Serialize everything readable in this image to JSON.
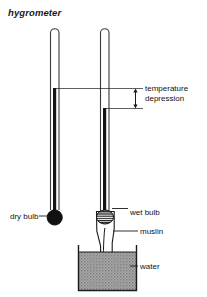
{
  "figure": {
    "title": "hygrometer",
    "type": "labelled-science-diagram",
    "canvas": {
      "width": 207,
      "height": 297
    },
    "colors": {
      "ink": "#1a1a1a",
      "tube_outline": "#3a3a3a",
      "mercury": "#141414",
      "bulb_fill": "#111111",
      "water_fill": "#9e9e9e",
      "background": "#ffffff"
    }
  },
  "labels": {
    "dry_bulb": "dry bulb",
    "wet_bulb": "wet bulb",
    "muslin": "muslin",
    "water": "water",
    "temperature_depression_line1": "temperature",
    "temperature_depression_line2": "depression"
  },
  "parts": [
    {
      "name": "dry-bulb-thermometer",
      "label": "dry bulb"
    },
    {
      "name": "wet-bulb-thermometer",
      "label": "wet bulb"
    },
    {
      "name": "muslin-wick",
      "label": "muslin"
    },
    {
      "name": "water-beaker",
      "label": "water"
    },
    {
      "name": "temperature-depression-measure",
      "label": "temperature depression"
    }
  ]
}
